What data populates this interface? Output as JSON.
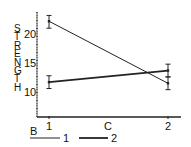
{
  "chart_data": {
    "type": "line",
    "title": "",
    "xlabel": "C",
    "ylabel": "STRENGTH",
    "categories": [
      "1",
      "2"
    ],
    "y_ticks": [
      10,
      15,
      20
    ],
    "ylim": [
      6,
      24
    ],
    "grid": false,
    "legend": {
      "title": "B",
      "position": "bottom",
      "entries": [
        "1",
        "2"
      ]
    },
    "series": [
      {
        "name": "1",
        "values": [
          22.2,
          11.5
        ],
        "error": [
          [
            21.0,
            23.2
          ],
          [
            10.4,
            12.6
          ]
        ],
        "line": "thin"
      },
      {
        "name": "2",
        "values": [
          11.7,
          13.7
        ],
        "error": [
          [
            10.6,
            12.8
          ],
          [
            12.6,
            14.8
          ]
        ],
        "line": "thick"
      }
    ]
  }
}
